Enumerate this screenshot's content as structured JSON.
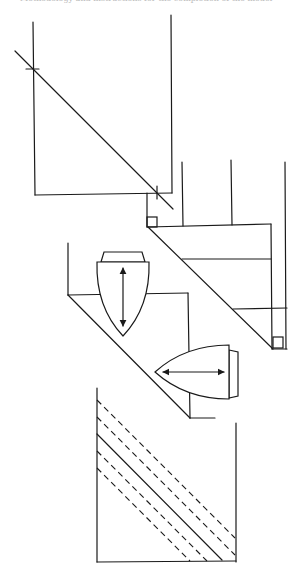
{
  "header": {
    "text": "Methodology and instructions for the completion of the model"
  },
  "diagram": {
    "stroke_color": "#1a1a1a",
    "background": "#ffffff",
    "panels": [
      {
        "id": "panel-1",
        "description": "Rectangle with diagonal line crossing two tick marks"
      },
      {
        "id": "panel-2",
        "description": "Stepped diagonal with right-angle markers and horizontal divisions"
      },
      {
        "id": "panel-3",
        "description": "Diagonal fold with two bullet-shaped iron icons and double-headed arrows"
      },
      {
        "id": "panel-4",
        "description": "Rectangle with dashed and solid diagonal lines"
      }
    ],
    "icons": [
      "iron-vertical-icon",
      "iron-horizontal-icon",
      "double-arrow-vertical-icon",
      "double-arrow-horizontal-icon",
      "right-angle-marker-icon"
    ]
  }
}
